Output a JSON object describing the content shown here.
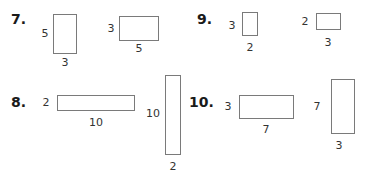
{
  "problems": [
    {
      "number": "7.",
      "figures": [
        {
          "side_label": "5",
          "bottom_label": "3"
        },
        {
          "side_label": "3",
          "bottom_label": "5"
        }
      ]
    },
    {
      "number": "8.",
      "figures": [
        {
          "side_label": "2",
          "bottom_label": "10"
        },
        {
          "side_label": "10",
          "bottom_label": "2"
        }
      ]
    },
    {
      "number": "9.",
      "figures": [
        {
          "side_label": "3",
          "bottom_label": "2"
        },
        {
          "side_label": "2",
          "bottom_label": "3"
        }
      ]
    },
    {
      "number": "10.",
      "figures": [
        {
          "side_label": "3",
          "bottom_label": "7"
        },
        {
          "side_label": "7",
          "bottom_label": "3"
        }
      ]
    }
  ]
}
